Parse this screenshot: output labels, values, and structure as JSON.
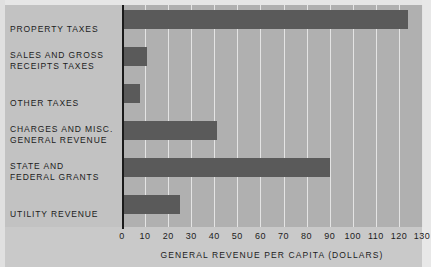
{
  "chart_data": {
    "type": "bar",
    "orientation": "horizontal",
    "title": "",
    "xlabel": "GENERAL REVENUE PER CAPITA (DOLLARS)",
    "ylabel": "",
    "xlim": [
      0,
      130
    ],
    "xticks": [
      0,
      10,
      20,
      30,
      40,
      50,
      60,
      70,
      80,
      90,
      100,
      110,
      120,
      130
    ],
    "xtick_labels": [
      "0",
      "10",
      "20",
      "30",
      "40",
      "50",
      "60",
      "70",
      "80",
      "90",
      "100",
      "110",
      "120",
      "130"
    ],
    "grid": true,
    "legend": false,
    "categories": [
      "PROPERTY TAXES",
      "SALES AND GROSS\nRECEIPTS TAXES",
      "OTHER TAXES",
      "CHARGES AND MISC.\nGENERAL REVENUE",
      "STATE AND\nFEDERAL GRANTS",
      "UTILITY REVENUE"
    ],
    "values": [
      124,
      11,
      8,
      41,
      90,
      25
    ],
    "bars": [
      {
        "label_line1": "PROPERTY TAXES",
        "label_line2": "",
        "value": 124
      },
      {
        "label_line1": "SALES AND GROSS",
        "label_line2": "RECEIPTS TAXES",
        "value": 11
      },
      {
        "label_line1": "OTHER TAXES",
        "label_line2": "",
        "value": 8
      },
      {
        "label_line1": "CHARGES AND MISC.",
        "label_line2": "GENERAL REVENUE",
        "value": 41
      },
      {
        "label_line1": "STATE AND",
        "label_line2": "FEDERAL GRANTS",
        "value": 90
      },
      {
        "label_line1": "UTILITY REVENUE",
        "label_line2": "",
        "value": 25
      }
    ],
    "colors": {
      "bar": "#5a5a5a",
      "plot_background": "#b0b0b0",
      "label_background": "#c2c2c2",
      "gridline": "#e4e4e4",
      "axis": "#1a1a1a",
      "text": "#1c1c1c"
    }
  }
}
